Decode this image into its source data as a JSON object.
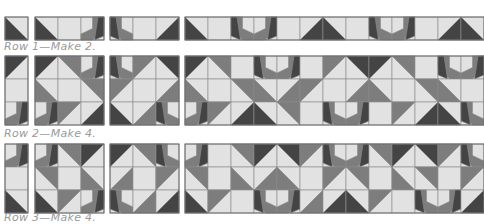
{
  "colors": {
    "light": "#e2e2e2",
    "medium": "#7d7d7d",
    "dark": "#444444",
    "line": "#8c8c8c",
    "label": "#9a9a9a"
  },
  "cell": 23,
  "rows": [
    {
      "label": "Row 1—Make 2.",
      "y": 17,
      "label_y": 41,
      "groups": [
        {
          "x": 5,
          "cells": [
            [
              "bl"
            ]
          ]
        },
        {
          "x": 35,
          "cells": [
            [
              "blR",
              "L",
              "leafR"
            ]
          ]
        },
        {
          "x": 110,
          "cells": [
            [
              "leafL",
              "L",
              "br"
            ]
          ]
        },
        {
          "x": 185,
          "cells": [
            [
              "blR",
              "L",
              "leafL",
              "leafR",
              "L",
              "br",
              "bl",
              "L",
              "leafL",
              "leafR",
              "L",
              "br",
              "bl"
            ]
          ]
        }
      ]
    },
    {
      "label": "Row 2—Make 4.",
      "y": 56,
      "label_y": 127,
      "groups": [
        {
          "x": 5,
          "cells": [
            [
              "trR"
            ],
            [
              "L"
            ],
            [
              "leafR"
            ]
          ]
        },
        {
          "x": 35,
          "cells": [
            [
              "tl",
              "mtr",
              "leafR"
            ],
            [
              "mbl",
              "L",
              "mtr"
            ],
            [
              "leafR",
              "mtl",
              "br"
            ]
          ]
        },
        {
          "x": 110,
          "cells": [
            [
              "leafL",
              "mtl",
              "tr"
            ],
            [
              "mtl",
              "L",
              "mbr"
            ],
            [
              "bl",
              "mbr",
              "leafL"
            ]
          ]
        },
        {
          "x": 185,
          "cells": [
            [
              "tl",
              "mtr",
              "L",
              "leafL",
              "leafR",
              "L",
              "mtl",
              "tr",
              "tl",
              "mtr",
              "L",
              "leafL",
              "leafR"
            ],
            [
              "mbl",
              "L",
              "mtr",
              "mbl",
              "mbr",
              "mtl",
              "L",
              "mbr",
              "mbl",
              "L",
              "mtr",
              "mbl",
              "L"
            ],
            [
              "leafR",
              "mtl",
              "br",
              "bl",
              "mtr",
              "L",
              "leafL",
              "leafR",
              "L",
              "mtl",
              "br",
              "bl",
              "leafL"
            ]
          ]
        }
      ]
    },
    {
      "label": "Row 3—Make 4.",
      "y": 144,
      "label_y": 213,
      "groups": [
        {
          "x": 5,
          "cells": [
            [
              "leafR"
            ],
            [
              "L"
            ],
            [
              "bl"
            ]
          ]
        },
        {
          "x": 35,
          "cells": [
            [
              "leafR",
              "mtr",
              "tl"
            ],
            [
              "mtr",
              "L",
              "mbl"
            ],
            [
              "bl",
              "mtl",
              "leafR"
            ]
          ]
        },
        {
          "x": 110,
          "cells": [
            [
              "tl",
              "mtr",
              "leafL"
            ],
            [
              "mbr",
              "L",
              "mtl"
            ],
            [
              "leafL",
              "mbr",
              "br"
            ]
          ]
        },
        {
          "x": 185,
          "cells": [
            [
              "leafR",
              "L",
              "mtr",
              "tl",
              "tr",
              "mtl",
              "leafL",
              "leafR",
              "mtr",
              "tl",
              "tr",
              "mtl",
              "leafL"
            ],
            [
              "mtr",
              "L",
              "mbl",
              "mbr",
              "mbl",
              "L",
              "mtl",
              "mtr",
              "L",
              "mbl",
              "mtr",
              "L",
              "mtl"
            ],
            [
              "bl",
              "mtl",
              "L",
              "leafL",
              "leafR",
              "mbr",
              "br",
              "bl",
              "mtl",
              "L",
              "leafL",
              "leafR",
              "br"
            ]
          ]
        }
      ]
    }
  ]
}
